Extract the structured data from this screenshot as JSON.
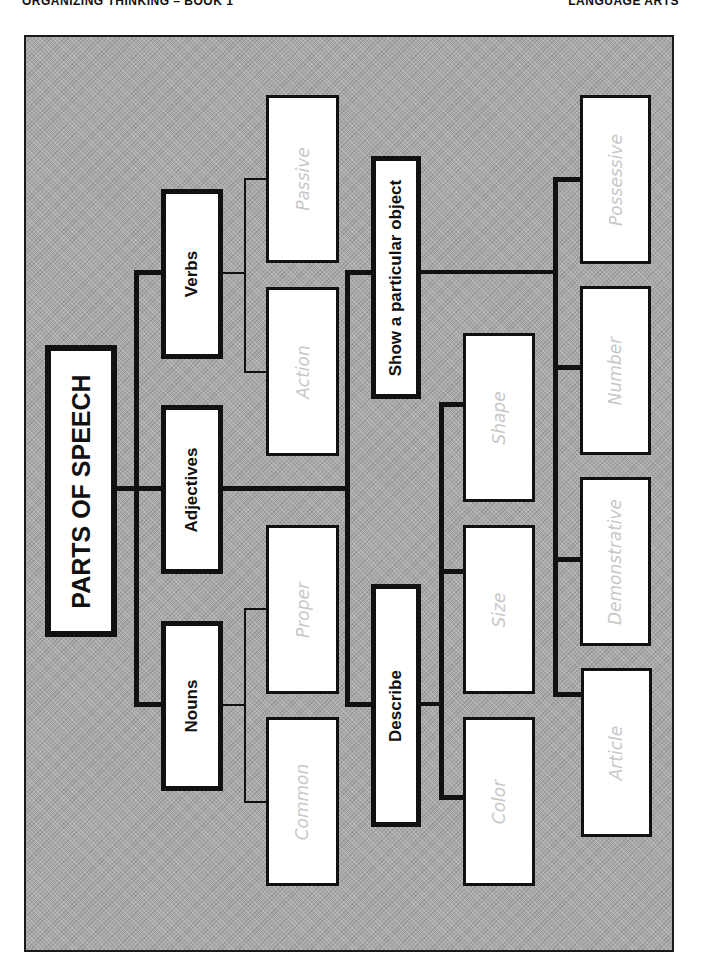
{
  "header": {
    "left": "ORGANIZING THINKING – BOOK 1",
    "right": "LANGUAGE ARTS"
  },
  "diagram": {
    "root": "PARTS OF SPEECH",
    "categories": [
      {
        "label": "Verbs",
        "children": [
          "Passive",
          "Action"
        ]
      },
      {
        "label": "Adjectives",
        "children": [
          "Show a particular object",
          "Describe"
        ]
      },
      {
        "label": "Nouns",
        "children": [
          "Proper",
          "Common"
        ]
      }
    ],
    "adjective_groups": [
      {
        "label": "Show a particular object",
        "children": [
          "Possessive",
          "Number",
          "Demonstrative",
          "Article"
        ]
      },
      {
        "label": "Describe",
        "children": [
          "Shape",
          "Size",
          "Color"
        ]
      }
    ]
  },
  "colors": {
    "background": "#a9a9a9",
    "border": "#111111",
    "box_fill": "#ffffff",
    "leaf_text": "#c8c8c8"
  }
}
